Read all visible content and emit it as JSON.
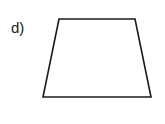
{
  "label": "d)",
  "shape": {
    "type": "trapezoid",
    "stroke_color": "#1a1a1a",
    "fill_color": "#ffffff",
    "points": "59,19 135,19 151,97 43,97"
  }
}
